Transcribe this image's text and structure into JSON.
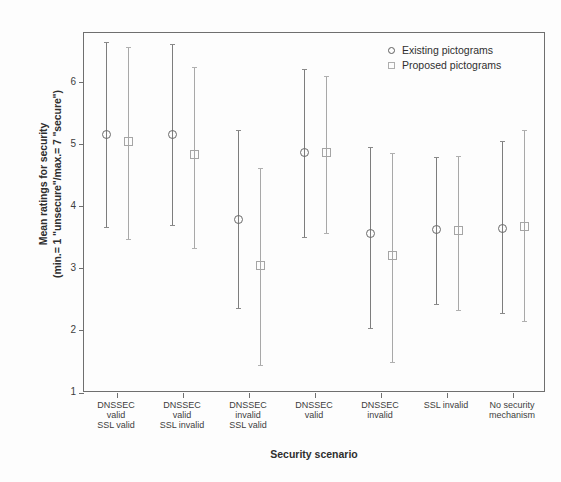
{
  "chart_data": {
    "type": "scatter",
    "title": "",
    "xlabel": "Security scenario",
    "ylabel_line1": "Mean ratings for security",
    "ylabel_line2": "(min.= 1 \"unsecure\"/max.= 7 \"secure\")",
    "ylim": [
      1,
      6.8
    ],
    "yticks": [
      1,
      2,
      3,
      4,
      5,
      6
    ],
    "ytick_labels": [
      "1",
      "2",
      "3",
      "4",
      "5",
      "6"
    ],
    "grid": false,
    "legend_position": "top-right",
    "error_bar_type": "95% CI",
    "categories": [
      "DNSSEC valid SSL valid",
      "DNSSEC valid SSL invalid",
      "DNSSEC invalid SSL valid",
      "DNSSEC valid",
      "DNSSEC invalid",
      "SSL invalid",
      "No security mechanism"
    ],
    "category_label_lines": [
      [
        "DNSSEC",
        "valid",
        "SSL valid"
      ],
      [
        "DNSSEC",
        "valid",
        "SSL invalid"
      ],
      [
        "DNSSEC",
        "invalid",
        "SSL valid"
      ],
      [
        "DNSSEC",
        "valid"
      ],
      [
        "DNSSEC",
        "invalid"
      ],
      [
        "SSL invalid"
      ],
      [
        "No security",
        "mechanism"
      ]
    ],
    "series": [
      {
        "name": "Existing pictograms",
        "marker": "circle",
        "color": "#6a6a6a",
        "values": [
          5.17,
          5.16,
          3.8,
          4.88,
          3.57,
          3.64,
          3.65
        ],
        "ci_low": [
          3.67,
          3.7,
          2.37,
          3.52,
          2.05,
          2.44,
          2.29
        ],
        "ci_high": [
          6.65,
          6.62,
          5.23,
          6.22,
          4.97,
          4.8,
          5.06
        ]
      },
      {
        "name": "Proposed pictograms",
        "marker": "square",
        "color": "#a5a5a5",
        "values": [
          5.05,
          4.84,
          3.06,
          4.87,
          3.22,
          3.62,
          3.69
        ],
        "ci_low": [
          3.48,
          3.33,
          1.45,
          3.58,
          1.5,
          2.34,
          2.16
        ],
        "ci_high": [
          6.57,
          6.26,
          4.62,
          6.11,
          4.86,
          4.82,
          5.24
        ]
      }
    ]
  },
  "legend": {
    "items": [
      {
        "label": "Existing pictograms",
        "marker": "circle"
      },
      {
        "label": "Proposed pictograms",
        "marker": "square"
      }
    ]
  },
  "axes": {
    "x_title": "Security scenario",
    "y_title_line1": "Mean ratings for security",
    "y_title_line2": "(min.= 1 \"unsecure\"/max.= 7 \"secure\")"
  }
}
